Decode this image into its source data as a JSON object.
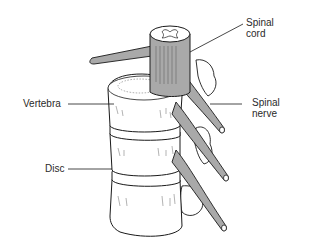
{
  "diagram": {
    "labels": {
      "spinal_cord_line1": "Spinal",
      "spinal_cord_line2": "cord",
      "spinal_nerve_line1": "Spinal",
      "spinal_nerve_line2": "nerve",
      "vertebra": "Vertebra",
      "disc": "Disc"
    },
    "colors": {
      "outline": "#1a1a1a",
      "nerve_fill": "#a9a9a9",
      "bone_fill": "#ffffff",
      "label_text": "#2a2a2a"
    }
  }
}
